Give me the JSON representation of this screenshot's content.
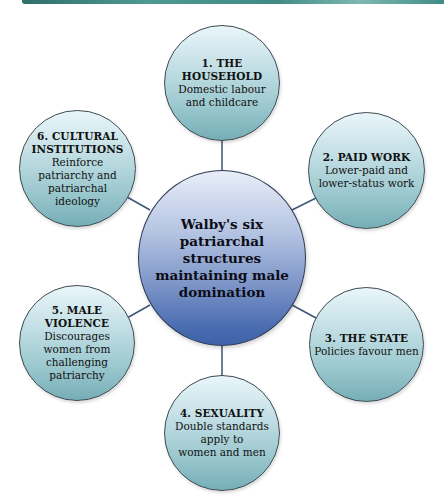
{
  "diagram": {
    "center": {
      "label": "Walby's six patriarchal structures maintaining male domination"
    },
    "nodes": [
      {
        "title": "1. THE HOUSEHOLD",
        "title_lines": [
          "1. THE",
          "HOUSEHOLD"
        ],
        "desc_lines": [
          "Domestic labour",
          "and childcare"
        ]
      },
      {
        "title": "2. PAID WORK",
        "title_lines": [
          "2. PAID WORK"
        ],
        "desc_lines": [
          "Lower-paid and",
          "lower-status work"
        ]
      },
      {
        "title": "3. THE STATE",
        "title_lines": [
          "3. THE STATE"
        ],
        "desc_lines": [
          "Policies favour men"
        ]
      },
      {
        "title": "4. SEXUALITY",
        "title_lines": [
          "4. SEXUALITY"
        ],
        "desc_lines": [
          "Double standards",
          "apply to",
          "women and men"
        ]
      },
      {
        "title": "5. MALE VIOLENCE",
        "title_lines": [
          "5. MALE",
          "VIOLENCE"
        ],
        "desc_lines": [
          "Discourages",
          "women from",
          "challenging",
          "patriarchy"
        ]
      },
      {
        "title": "6. CULTURAL INSTITUTIONS",
        "title_lines": [
          "6. CULTURAL",
          "INSTITUTIONS"
        ],
        "desc_lines": [
          "Reinforce",
          "patriarchy and",
          "patriarchal",
          "ideology"
        ]
      }
    ],
    "colors": {
      "node_fill_top": "#e9f6fa",
      "node_fill_bottom": "#76aeb6",
      "center_fill_top": "#e8eef8",
      "center_fill_bottom": "#3e62a8",
      "connector": "#3b5577",
      "top_bar": "#3f8a84"
    }
  }
}
